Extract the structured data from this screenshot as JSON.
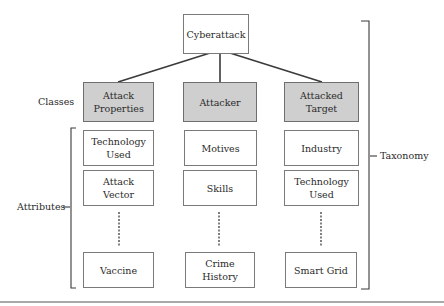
{
  "diagram": {
    "root": {
      "label": "Cyberattack"
    },
    "row_labels": {
      "classes": "Classes",
      "attributes": "Attributes"
    },
    "bracket_label": "Taxonomy",
    "classes": [
      {
        "label": "Attack Properties",
        "attributes": [
          "Technology Used",
          "Attack Vector",
          "Vaccine"
        ]
      },
      {
        "label": "Attacker",
        "attributes": [
          "Motives",
          "Skills",
          "Crime History"
        ]
      },
      {
        "label": "Attacked Target",
        "attributes": [
          "Industry",
          "Technology Used",
          "Smart Grid"
        ]
      }
    ],
    "colors": {
      "class_fill": "#cfcfcf",
      "box_border": "#7a7a7a",
      "line": "#3a3a3a"
    }
  }
}
